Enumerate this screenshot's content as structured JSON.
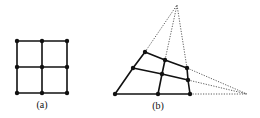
{
  "figure": {
    "panels": [
      {
        "label": "(a)",
        "label_pos": [
          42,
          99
        ],
        "description": "Regular 3x3 grid of points joined by solid lines",
        "points": [
          [
            17,
            41
          ],
          [
            42,
            41
          ],
          [
            67,
            41
          ],
          [
            17,
            67
          ],
          [
            42,
            67
          ],
          [
            67,
            67
          ],
          [
            17,
            93
          ],
          [
            42,
            93
          ],
          [
            67,
            93
          ]
        ]
      },
      {
        "label": "(b)",
        "label_pos": [
          158,
          100
        ],
        "description": "Perspective-distorted grid with dotted lines converging to two vanishing points",
        "points": [
          [
            145,
            52
          ],
          [
            165,
            60
          ],
          [
            187,
            68
          ],
          [
            133,
            68
          ],
          [
            162,
            74
          ],
          [
            188,
            80
          ],
          [
            115,
            94
          ],
          [
            158,
            94
          ],
          [
            190,
            94
          ]
        ],
        "vanishing_points": [
          [
            177,
            5
          ],
          [
            247,
            94
          ]
        ]
      }
    ],
    "colors": {
      "line": "#111111",
      "dotted": "#333333"
    }
  }
}
